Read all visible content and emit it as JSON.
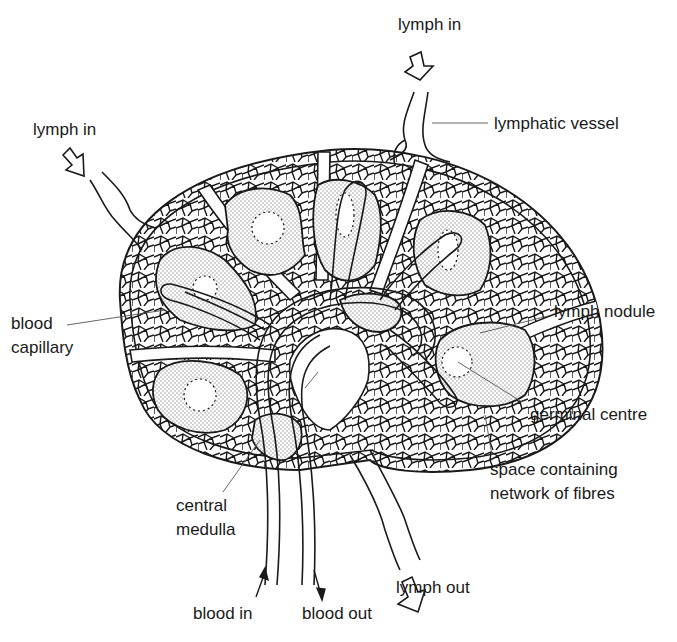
{
  "diagram": {
    "labels": {
      "lymph_in_top": "lymph in",
      "lymph_in_left": "lymph in",
      "lymphatic_vessel": "lymphatic vessel",
      "blood_capillary_line1": "blood",
      "blood_capillary_line2": "capillary",
      "lymph_nodule": "lymph nodule",
      "germinal_centre": "germinal centre",
      "space_line1": "space containing",
      "space_line2": "network of fibres",
      "central_medulla_line1": "central",
      "central_medulla_line2": "medulla",
      "blood_in": "blood in",
      "blood_out": "blood out",
      "lymph_out": "lymph out"
    },
    "colors": {
      "line": "#1a1a1a",
      "stipple": "#9a9a9a",
      "background": "#ffffff"
    }
  }
}
